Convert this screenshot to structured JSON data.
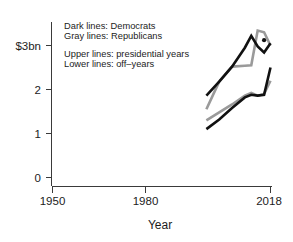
{
  "chart_data": {
    "type": "line",
    "title": "",
    "xlabel": "Year",
    "ylabel": "",
    "xlim": [
      1950,
      2018
    ],
    "ylim": [
      0,
      3.35
    ],
    "grid": false,
    "legend_position": "inside-top-left",
    "x_ticks": [
      {
        "value": 1950,
        "label": "1950"
      },
      {
        "value": 1980,
        "label": "1980"
      },
      {
        "value": 2018,
        "label": "2018"
      }
    ],
    "y_ticks": [
      {
        "value": 0,
        "label": "0"
      },
      {
        "value": 1,
        "label": "1"
      },
      {
        "value": 2,
        "label": "2"
      },
      {
        "value": 3,
        "label": "$3bn"
      }
    ],
    "units": "billions of US dollars",
    "annotations": [
      "Dark lines: Democrats",
      "Gray lines: Republicans",
      "Upper lines: presidential years",
      "Lower lines: off–years"
    ],
    "series": [
      {
        "name": "Democrats – presidential years",
        "group": "upper",
        "party": "Democrats",
        "color": "#111111",
        "x": [
          1998,
          2002,
          2006,
          2010,
          2012,
          2014,
          2016,
          2018
        ],
        "values": [
          1.86,
          2.18,
          2.52,
          2.95,
          3.22,
          2.98,
          2.84,
          3.05
        ]
      },
      {
        "name": "Republicans – presidential years",
        "group": "upper",
        "party": "Republicans",
        "color": "#9a9a9a",
        "x": [
          1998,
          2002,
          2006,
          2010,
          2012,
          2014,
          2016,
          2018
        ],
        "values": [
          1.55,
          2.18,
          2.52,
          2.54,
          2.55,
          3.34,
          3.3,
          3.0
        ]
      },
      {
        "name": "Democrats – off–years",
        "group": "lower",
        "party": "Democrats",
        "color": "#111111",
        "x": [
          1998,
          2002,
          2006,
          2010,
          2012,
          2014,
          2016,
          2018
        ],
        "values": [
          1.1,
          1.32,
          1.58,
          1.82,
          1.88,
          1.86,
          1.88,
          2.5
        ]
      },
      {
        "name": "Republicans – off–years",
        "group": "lower",
        "party": "Republicans",
        "color": "#9a9a9a",
        "x": [
          1998,
          2002,
          2006,
          2010,
          2012,
          2014,
          2016,
          2018
        ],
        "values": [
          1.3,
          1.48,
          1.66,
          1.86,
          1.92,
          1.86,
          1.9,
          2.2
        ]
      }
    ],
    "markers": [
      {
        "series": "Democrats – presidential years",
        "x": 2016,
        "y": 3.12
      }
    ]
  },
  "axis": {
    "y_label_3bn": "$3bn",
    "y_label_2": "2",
    "y_label_1": "1",
    "y_label_0": "0",
    "x_label_1950": "1950",
    "x_label_1980": "1980",
    "x_label_2018": "2018",
    "x_title": "Year"
  },
  "notes": {
    "line1": "Dark lines: Democrats",
    "line2": "Gray lines: Republicans",
    "line3": "Upper lines: presidential years",
    "line4": "Lower lines: off–years"
  }
}
